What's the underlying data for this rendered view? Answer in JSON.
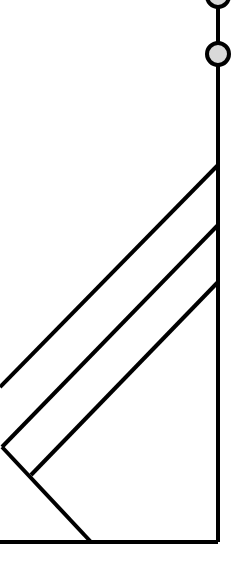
{
  "diagram": {
    "type": "line-diagram",
    "stroke_color": "#000000",
    "node_fill": "#d9d9d9",
    "background": "#ffffff",
    "nodes": [
      {
        "name": "node-top",
        "cx": 218,
        "cy": -4,
        "r": 11
      },
      {
        "name": "node-second",
        "cx": 218,
        "cy": 54,
        "r": 11
      }
    ],
    "lines": [
      {
        "name": "vertical-trunk",
        "points": [
          [
            218,
            0
          ],
          [
            218,
            542
          ]
        ]
      },
      {
        "name": "bottom-baseline",
        "points": [
          [
            0,
            542
          ],
          [
            218,
            542
          ]
        ]
      },
      {
        "name": "diagonal-1",
        "points": [
          [
            218,
            165
          ],
          [
            0,
            387
          ]
        ]
      },
      {
        "name": "diagonal-2",
        "points": [
          [
            218,
            225
          ],
          [
            2,
            447
          ]
        ]
      },
      {
        "name": "diagonal-3",
        "points": [
          [
            218,
            282
          ],
          [
            31,
            475
          ]
        ]
      },
      {
        "name": "descending-leg",
        "points": [
          [
            2,
            447
          ],
          [
            91,
            542
          ]
        ]
      }
    ]
  }
}
